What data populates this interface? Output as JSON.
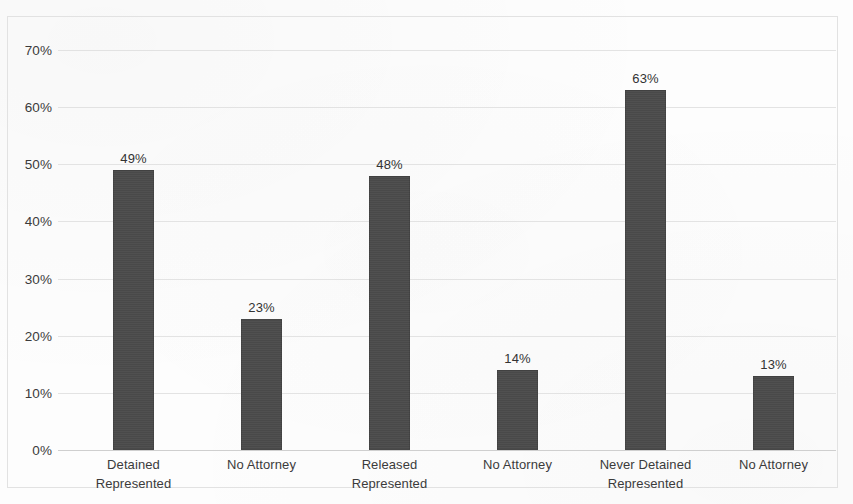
{
  "chart_data": {
    "type": "bar",
    "title": "",
    "subtitle": "",
    "xlabel": "",
    "ylabel": "",
    "categories": [
      "Detained\nRepresented",
      "No Attorney",
      "Released\nRepresented",
      "No Attorney",
      "Never Detained\nRepresented",
      "No Attorney"
    ],
    "category_lines": [
      [
        "Detained",
        "Represented"
      ],
      [
        "No Attorney",
        ""
      ],
      [
        "Released",
        "Represented"
      ],
      [
        "No Attorney",
        ""
      ],
      [
        "Never Detained",
        "Represented"
      ],
      [
        "No Attorney",
        ""
      ]
    ],
    "values": [
      49,
      23,
      48,
      14,
      63,
      13
    ],
    "value_labels": [
      "49%",
      "23%",
      "48%",
      "14%",
      "63%",
      "13%"
    ],
    "ylim": [
      0,
      70
    ],
    "ytick_values": [
      70,
      60,
      50,
      40,
      30,
      20,
      10,
      0
    ],
    "ytick_labels": [
      "70%",
      "60%",
      "50%",
      "40%",
      "30%",
      "20%",
      "10%",
      "0%"
    ],
    "grid": true,
    "legend": false,
    "legend_position": "none",
    "series_color": "#4a4a4a",
    "gridline_color": "#dedede",
    "axis_label_color": "#3b3b3b"
  }
}
